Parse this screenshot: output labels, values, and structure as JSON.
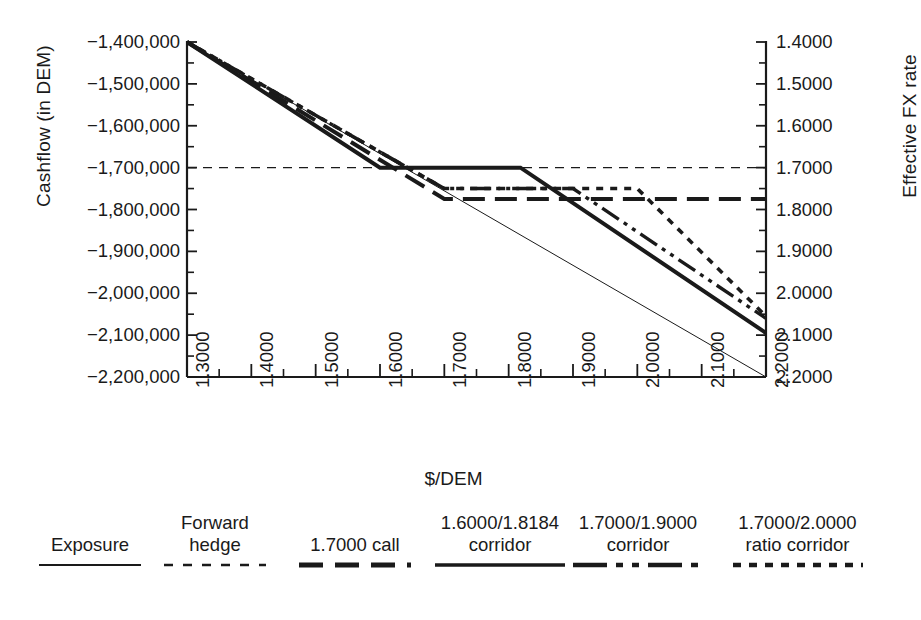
{
  "chart_data": {
    "type": "line",
    "title": "",
    "xlabel": "$/DEM",
    "ylabel": "Cashflow (in DEM)",
    "ylabel_right": "Effective FX rate",
    "xlim": [
      1.3,
      2.2
    ],
    "ylim": [
      -2200000,
      -1400000
    ],
    "ylim_right": [
      2.2,
      1.4
    ],
    "grid": false,
    "legend_position": "below",
    "x_ticks": [
      "1.3000",
      "1.4000",
      "1.5000",
      "1.6000",
      "1.7000",
      "1.8000",
      "1.9000",
      "2.0000",
      "2.1000",
      "2.2000"
    ],
    "x_tick_values": [
      1.3,
      1.4,
      1.5,
      1.6,
      1.7,
      1.8,
      1.9,
      2.0,
      2.1,
      2.2
    ],
    "x_minor_ticks": [
      1.35,
      1.45,
      1.55,
      1.65,
      1.75,
      1.85,
      1.95,
      2.05,
      2.15
    ],
    "y_ticks_left": [
      "-1,400,000",
      "-1,500,000",
      "-1,600,000",
      "-1,700,000",
      "-1,800,000",
      "-1,900,000",
      "-2,000,000",
      "-2,100,000",
      "-2,200,000"
    ],
    "y_tick_values_left": [
      -1400000,
      -1500000,
      -1600000,
      -1700000,
      -1800000,
      -1900000,
      -2000000,
      -2100000,
      -2200000
    ],
    "y_ticks_right": [
      "1.4000",
      "1.5000",
      "1.6000",
      "1.7000",
      "1.8000",
      "1.9000",
      "2.0000",
      "2.1000",
      "2.2000"
    ],
    "y_tick_values_right": [
      1.4,
      1.5,
      1.6,
      1.7,
      1.8,
      1.9,
      2.0,
      2.1,
      2.2
    ],
    "series": [
      {
        "name": "Exposure",
        "style": "thin-solid",
        "linewidth": 1,
        "dash": "",
        "points": [
          [
            1.3,
            -1400000
          ],
          [
            2.2,
            -2200000
          ]
        ]
      },
      {
        "name": "Forward hedge",
        "style": "thin-dashed",
        "linewidth": 1.4,
        "dash": "9,7",
        "points": [
          [
            1.3,
            -1700000
          ],
          [
            2.2,
            -1700000
          ]
        ]
      },
      {
        "name": "1.7000 call",
        "style": "thick-dashed",
        "linewidth": 4,
        "dash": "22,10",
        "points": [
          [
            1.3,
            -1400000
          ],
          [
            1.7,
            -1775000
          ],
          [
            2.2,
            -1775000
          ]
        ]
      },
      {
        "name": "1.6000/1.8184 corridor",
        "style": "thick-solid",
        "linewidth": 4,
        "dash": "",
        "points": [
          [
            1.3,
            -1400000
          ],
          [
            1.6,
            -1700000
          ],
          [
            1.8184,
            -1700000
          ],
          [
            2.2,
            -2095000
          ]
        ]
      },
      {
        "name": "1.7000/1.9000 corridor",
        "style": "dash-dot-dot",
        "linewidth": 3.4,
        "dash": "20,6,4,6,4,6",
        "points": [
          [
            1.3,
            -1400000
          ],
          [
            1.7,
            -1750000
          ],
          [
            1.9,
            -1750000
          ],
          [
            2.2,
            -2060000
          ]
        ]
      },
      {
        "name": "1.7000/2.0000 ratio corridor",
        "style": "thick-dotted",
        "linewidth": 3.6,
        "dash": "7,7",
        "points": [
          [
            1.3,
            -1400000
          ],
          [
            1.7,
            -1750000
          ],
          [
            2.0,
            -1750000
          ],
          [
            2.2,
            -2055000
          ]
        ]
      }
    ]
  },
  "axes": {
    "x_title": "$/DEM",
    "y_title_left": "Cashflow (in DEM)",
    "y_title_right": "Effective FX rate"
  },
  "legend": {
    "items": [
      {
        "lines": [
          "Exposure"
        ],
        "style": "thin-solid"
      },
      {
        "lines": [
          "Forward",
          "hedge"
        ],
        "style": "thin-dashed"
      },
      {
        "lines": [
          "1.7000 call"
        ],
        "style": "thick-dashed"
      },
      {
        "lines": [
          "1.6000/1.8184",
          "corridor"
        ],
        "style": "thick-solid"
      },
      {
        "lines": [
          "1.7000/1.9000",
          "corridor"
        ],
        "style": "dash-dot-dot"
      },
      {
        "lines": [
          "1.7000/2.0000",
          "ratio corridor"
        ],
        "style": "thick-dotted"
      }
    ]
  },
  "colors": {
    "line": "#1a1a1a",
    "axis": "#1a1a1a",
    "background": "#ffffff"
  }
}
